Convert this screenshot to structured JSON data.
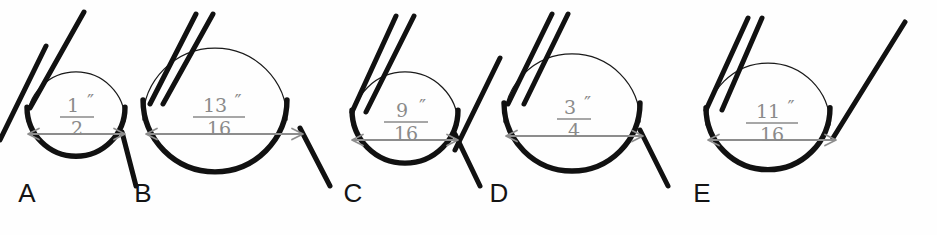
{
  "figure": {
    "background_color": "#fefefe",
    "wire_color": "#111111",
    "dimension_color": "#8d8d8d",
    "fraction_text_color": "#8a8a8a",
    "label_color": "#141414",
    "unit_symbol": "″"
  },
  "items": [
    {
      "label": "A",
      "numerator": "1",
      "denominator": "2",
      "unit": "″",
      "value_inches": 0.5,
      "label_x": 27,
      "label_y": 202,
      "circle_cx": 76,
      "circle_cy": 121,
      "circle_r": 49,
      "dim_y": 134,
      "dim_x1": 28,
      "dim_x2": 125,
      "frac_cx": 77,
      "frac_num_y": 112,
      "frac_bar_y": 117,
      "frac_den_y": 135,
      "frac_bar_w": 17,
      "legs": [
        {
          "x1": 30,
          "y1": 108,
          "x2": 84,
          "y2": 12
        }
      ],
      "leg_count": 1,
      "exit_leg": {
        "x1": 122,
        "y1": 132,
        "x2": 136,
        "y2": 186
      }
    },
    {
      "label": "B",
      "numerator": "13",
      "denominator": "16",
      "unit": "″",
      "value_inches": 0.8125,
      "label_x": 143,
      "label_y": 202,
      "circle_cx": 215,
      "circle_cy": 120,
      "circle_r": 72,
      "dim_y": 134,
      "dim_x1": 146,
      "dim_x2": 303,
      "frac_cx": 219,
      "frac_num_y": 112,
      "frac_bar_y": 117,
      "frac_den_y": 135,
      "frac_bar_w": 26,
      "legs": [
        {
          "x1": 150,
          "y1": 104,
          "x2": 196,
          "y2": 14
        },
        {
          "x1": 163,
          "y1": 104,
          "x2": 213,
          "y2": 14
        }
      ],
      "leg_count": 2,
      "exit_leg": {
        "x1": 300,
        "y1": 128,
        "x2": 330,
        "y2": 186
      }
    },
    {
      "label": "C",
      "numerator": "9",
      "denominator": "16",
      "unit": "″",
      "value_inches": 0.5625,
      "label_x": 353,
      "label_y": 202,
      "circle_cx": 405,
      "circle_cy": 125,
      "circle_r": 53,
      "dim_y": 140,
      "dim_x1": 352,
      "dim_x2": 458,
      "frac_cx": 406,
      "frac_num_y": 117,
      "frac_bar_y": 122,
      "frac_den_y": 140,
      "frac_bar_w": 22,
      "legs": [
        {
          "x1": 352,
          "y1": 112,
          "x2": 396,
          "y2": 16
        },
        {
          "x1": 366,
          "y1": 112,
          "x2": 414,
          "y2": 16
        }
      ],
      "leg_count": 2,
      "exit_leg": {
        "x1": 455,
        "y1": 134,
        "x2": 480,
        "y2": 186
      }
    },
    {
      "label": "D",
      "numerator": "3",
      "denominator": "4",
      "unit": "″",
      "value_inches": 0.75,
      "label_x": 499,
      "label_y": 202,
      "circle_cx": 572,
      "circle_cy": 122,
      "circle_r": 68,
      "dim_y": 136,
      "dim_x1": 506,
      "dim_x2": 643,
      "frac_cx": 574,
      "frac_num_y": 114,
      "frac_bar_y": 119,
      "frac_den_y": 137,
      "frac_bar_w": 17,
      "legs": [
        {
          "x1": 508,
          "y1": 104,
          "x2": 552,
          "y2": 14
        },
        {
          "x1": 524,
          "y1": 104,
          "x2": 568,
          "y2": 14
        }
      ],
      "leg_count": 2,
      "exit_leg": {
        "x1": 640,
        "y1": 130,
        "x2": 668,
        "y2": 186
      }
    },
    {
      "label": "E",
      "numerator": "11",
      "denominator": "16",
      "unit": "″",
      "value_inches": 0.6875,
      "label_x": 702,
      "label_y": 202,
      "circle_cx": 768,
      "circle_cy": 125,
      "circle_r": 62,
      "dim_y": 140,
      "dim_x1": 708,
      "dim_x2": 836,
      "frac_cx": 772,
      "frac_num_y": 118,
      "frac_bar_y": 123,
      "frac_den_y": 141,
      "frac_bar_w": 26,
      "legs": [
        {
          "x1": 706,
          "y1": 110,
          "x2": 748,
          "y2": 18
        },
        {
          "x1": 722,
          "y1": 110,
          "x2": 762,
          "y2": 18
        }
      ],
      "leg_count": 2,
      "exit_leg": {
        "x1": 833,
        "y1": 138,
        "x2": 905,
        "y2": 22
      }
    }
  ],
  "extra_legs": [
    {
      "name": "left-edge-leg-b",
      "x1": 0,
      "y1": 140,
      "x2": 46,
      "y2": 46
    },
    {
      "name": "left-edge-leg-d",
      "x1": 455,
      "y1": 150,
      "x2": 500,
      "y2": 58
    }
  ]
}
